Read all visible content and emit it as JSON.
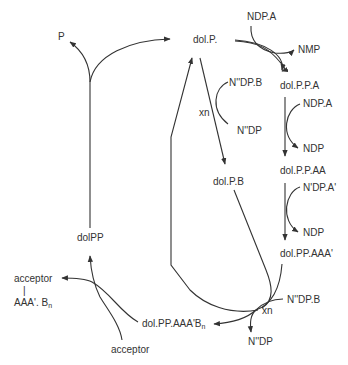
{
  "diagram": {
    "nodes": {
      "p": "P",
      "dolP": "dol.P.",
      "ndpA_1": "NDP.A",
      "nmp": "NMP",
      "dolPPA": "dol.P.P.A",
      "nddpB_1": "N''DP.B",
      "xn_1": "xn",
      "nddp_1": "N''DP",
      "ndpA_2": "NDP.A",
      "ndp_1": "NDP",
      "dolPB": "dol.P.B",
      "dolPPAA": "dol.P.P.AA",
      "ndpA_prime": "N'DP.A'",
      "ndp_2": "NDP",
      "dolPPAAA": "dol.PP.AAA'",
      "nddpB_2": "N''DP.B",
      "xn_2": "xn",
      "nddp_2": "N''DP",
      "dolPPAAABn": "dol.PP.AAA'B",
      "dolPPAAABn_sub": "n",
      "dolPP": "dolPP",
      "acceptor_top": "acceptor",
      "acceptor_bar": "|",
      "acceptor_product": "AAA'. B",
      "acceptor_product_sub": "n",
      "acceptor_bottom": "acceptor"
    },
    "colors": {
      "line": "#333333",
      "text": "#333333",
      "background": "#ffffff"
    }
  }
}
